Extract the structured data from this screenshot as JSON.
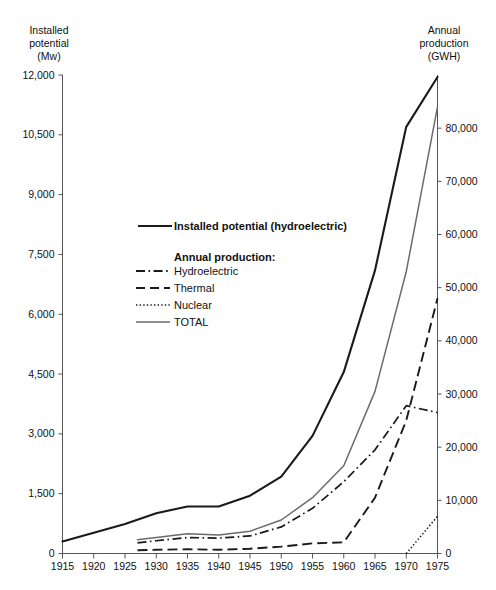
{
  "left_axis": {
    "title": "Installed\npotential\n(Mw)",
    "ticks": [
      "0",
      "1,500",
      "3,000",
      "4,500",
      "6,000",
      "7,500",
      "9,000",
      "10,500",
      "12,000"
    ]
  },
  "right_axis": {
    "title": "Annual\nproduction\n(GWH)",
    "ticks": [
      "0",
      "10,000",
      "20,000",
      "30,000",
      "40,000",
      "50,000",
      "60,000",
      "70,000",
      "80,000"
    ]
  },
  "x_axis": {
    "ticks": [
      "1915",
      "1920",
      "1925",
      "1930",
      "1935",
      "1940",
      "1945",
      "1950",
      "1955",
      "1960",
      "1965",
      "1970",
      "1975"
    ]
  },
  "legend": {
    "installed_label": "Installed potential (hydroelectric)",
    "group_heading": "Annual production:",
    "hydro_label": "Hydroelectric",
    "thermal_label": "Thermal",
    "nuclear_label": "Nuclear",
    "total_label": "TOTAL"
  },
  "footnote": "",
  "colors": {
    "installed": "#1a1a1a",
    "total": "#6b6b6b",
    "hydroelectric": "#1a1a1a",
    "thermal": "#1a1a1a",
    "nuclear": "#1a1a1a",
    "axis": "#555555"
  },
  "chart_data": {
    "type": "line",
    "title": "",
    "xlabel": "",
    "ylabel": "Installed potential (Mw)",
    "y2label": "Annual production (GWH)",
    "xlim": [
      1915,
      1975
    ],
    "ylim": [
      0,
      12000
    ],
    "y2lim": [
      0,
      90000
    ],
    "grid": false,
    "legend_position": "inside-upper-left",
    "x_ticks": [
      1915,
      1920,
      1925,
      1930,
      1935,
      1940,
      1945,
      1950,
      1955,
      1960,
      1965,
      1970,
      1975
    ],
    "y_ticks": [
      0,
      1500,
      3000,
      4500,
      6000,
      7500,
      9000,
      10500,
      12000
    ],
    "y2_ticks": [
      0,
      10000,
      20000,
      30000,
      40000,
      50000,
      60000,
      70000,
      80000
    ],
    "series": [
      {
        "name": "Installed potential (hydroelectric)",
        "axis": "left",
        "units": "Mw",
        "style": "solid-bold",
        "x": [
          1915,
          1920,
          1925,
          1930,
          1935,
          1940,
          1945,
          1950,
          1955,
          1960,
          1965,
          1970,
          1975
        ],
        "values": [
          300,
          520,
          740,
          1010,
          1180,
          1180,
          1450,
          1930,
          2950,
          4550,
          7100,
          10700,
          11950
        ]
      },
      {
        "name": "TOTAL",
        "axis": "right",
        "units": "GWH",
        "style": "solid-thin",
        "x": [
          1927,
          1930,
          1935,
          1940,
          1945,
          1950,
          1955,
          1960,
          1965,
          1970,
          1975
        ],
        "values": [
          2600,
          3000,
          3700,
          3500,
          4200,
          6300,
          10500,
          16500,
          30500,
          53000,
          84000
        ]
      },
      {
        "name": "Hydroelectric",
        "axis": "right",
        "units": "GWH",
        "style": "dash-dot",
        "x": [
          1927,
          1930,
          1935,
          1940,
          1945,
          1950,
          1955,
          1960,
          1965,
          1970,
          1975
        ],
        "values": [
          2000,
          2400,
          3000,
          2900,
          3300,
          5000,
          8500,
          13500,
          19500,
          27800,
          26500
        ]
      },
      {
        "name": "Thermal",
        "axis": "right",
        "units": "GWH",
        "style": "dashed",
        "x": [
          1927,
          1930,
          1935,
          1940,
          1945,
          1950,
          1955,
          1960,
          1965,
          1970,
          1975
        ],
        "values": [
          600,
          700,
          800,
          700,
          900,
          1300,
          1900,
          2100,
          10500,
          25000,
          48000
        ]
      },
      {
        "name": "Nuclear",
        "axis": "right",
        "units": "GWH",
        "style": "dotted",
        "x": [
          1970,
          1975
        ],
        "values": [
          0,
          7000
        ]
      }
    ]
  }
}
